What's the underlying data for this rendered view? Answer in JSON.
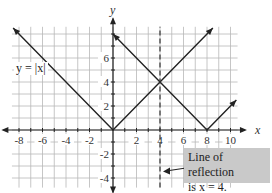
{
  "chart_data": {
    "type": "line",
    "title": "",
    "xlabel": "x",
    "ylabel": "y",
    "xlim": [
      -8.5,
      10.8
    ],
    "ylim": [
      -4.8,
      8.6
    ],
    "grid": true,
    "x_ticks": [
      -8,
      -6,
      -4,
      -2,
      2,
      4,
      6,
      8,
      10
    ],
    "y_ticks": [
      -4,
      -2,
      2,
      4,
      6
    ],
    "x_tick_labels": [
      "-8",
      "-6",
      "-4",
      "-2",
      "2",
      "4",
      "6",
      "8",
      "10"
    ],
    "y_tick_labels": [
      "-4",
      "-2",
      "2",
      "4",
      "6"
    ],
    "series": [
      {
        "name": "y = |x|",
        "x": [
          -8.5,
          0,
          8.5
        ],
        "y": [
          8.5,
          0,
          8.5
        ],
        "style": "solid"
      },
      {
        "name": "reflected graph y = |x - 8|",
        "x": [
          0,
          8,
          10.5
        ],
        "y": [
          8,
          0,
          2.5
        ],
        "style": "solid"
      },
      {
        "name": "Line of reflection x = 4",
        "x": [
          4,
          4
        ],
        "y": [
          -4.8,
          8.6
        ],
        "style": "dashed"
      }
    ],
    "annotations": [
      {
        "text": "y = |x|",
        "x": -7.5,
        "y": 5.5
      },
      {
        "text": "Line of reflection is x = 4.",
        "x": 7,
        "y": -3,
        "arrow_to": [
          4,
          -3
        ]
      }
    ]
  },
  "labels": {
    "x_axis": "x",
    "y_axis": "y",
    "equation": "y = |x|",
    "callout_line1": "Line of reflection",
    "callout_line2": "is x = 4."
  }
}
